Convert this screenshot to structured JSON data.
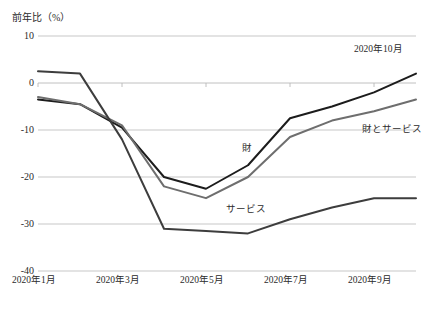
{
  "chart_data": {
    "type": "line",
    "title": "",
    "subtitle": "",
    "xlabel": "",
    "ylabel": "前年比（%）",
    "ylim": [
      -40,
      10
    ],
    "xlim": [
      "2020年1月",
      "2020年10月"
    ],
    "grid": true,
    "legend_position": "inline-annotations",
    "x": [
      "2020年1月",
      "2020年2月",
      "2020年3月",
      "2020年4月",
      "2020年5月",
      "2020年6月",
      "2020年7月",
      "2020年8月",
      "2020年9月",
      "2020年10月"
    ],
    "categories": [
      "2020年1月",
      "2020年2月",
      "2020年3月",
      "2020年4月",
      "2020年5月",
      "2020年6月",
      "2020年7月",
      "2020年8月",
      "2020年9月",
      "2020年10月"
    ],
    "ytick_labels": [
      "10",
      "0",
      "-10",
      "-20",
      "-30",
      "-40"
    ],
    "ytick_values": [
      10,
      0,
      -10,
      -20,
      -30,
      -40
    ],
    "xtick_labels": [
      "2020年1月",
      "2020年3月",
      "2020年5月",
      "2020年7月",
      "2020年9月"
    ],
    "xtick_values": [
      "2020年1月",
      "2020年3月",
      "2020年5月",
      "2020年7月",
      "2020年9月"
    ],
    "series": [
      {
        "name": "財",
        "label": "財",
        "color": "#1c1c1c",
        "values": [
          -3.5,
          -4.5,
          -9.5,
          -20.0,
          -22.5,
          -17.5,
          -7.5,
          -5.0,
          -2.0,
          2.0
        ]
      },
      {
        "name": "財とサービス",
        "label": "財とサービス",
        "color": "#6e6e6e",
        "values": [
          -3.0,
          -4.5,
          -9.0,
          -22.0,
          -24.5,
          -20.0,
          -11.5,
          -8.0,
          -6.0,
          -3.5
        ]
      },
      {
        "name": "サービス",
        "label": "サービス",
        "color": "#3d3d3d",
        "values": [
          2.5,
          2.0,
          -12.0,
          -31.0,
          -31.5,
          -32.0,
          -29.0,
          -26.5,
          -24.5,
          -24.5
        ]
      }
    ],
    "annotations": [
      {
        "text": "2020年10月",
        "x": "2020年10月",
        "y": 7
      },
      {
        "text": "財",
        "x": "2020年6月",
        "y": -14
      },
      {
        "text": "サービス",
        "x": "2020年6月",
        "y": -27
      },
      {
        "text": "財とサービス",
        "x": "2020年10月",
        "y": -10
      }
    ]
  },
  "axis": {
    "y_title": "前年比（%）"
  },
  "colors": {
    "goods": "#1c1c1c",
    "services": "#3d3d3d",
    "goods_and_services": "#6e6e6e",
    "grid": "#b9b9b9",
    "text": "#2b2b2b"
  }
}
